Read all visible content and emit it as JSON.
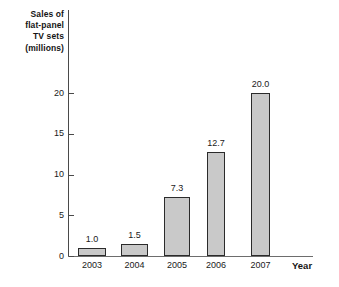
{
  "chart_data": {
    "type": "bar",
    "title": "Sales of flat-panel TV sets (millions)",
    "title_lines": [
      "Sales of",
      "flat-panel",
      "TV sets",
      "(millions)"
    ],
    "xlabel": "Year",
    "ylabel": "Sales of flat-panel TV sets (millions)",
    "categories": [
      "2003",
      "2004",
      "2005",
      "2006",
      "2007"
    ],
    "values": [
      1.0,
      1.5,
      7.3,
      12.7,
      20.0
    ],
    "value_labels": [
      "1.0",
      "1.5",
      "7.3",
      "12.7",
      "20.0"
    ],
    "ylim": [
      0,
      22
    ],
    "yticks": [
      0,
      5,
      10,
      15,
      20
    ],
    "ytick_labels": [
      "0",
      "5",
      "10",
      "15",
      "20"
    ],
    "grid": false,
    "legend": false,
    "bar_fill_color": "#c9c9c9",
    "bar_border_color": "#2b2b2b",
    "axis_color": "#4a4a4a",
    "background_color": "#ffffff"
  }
}
